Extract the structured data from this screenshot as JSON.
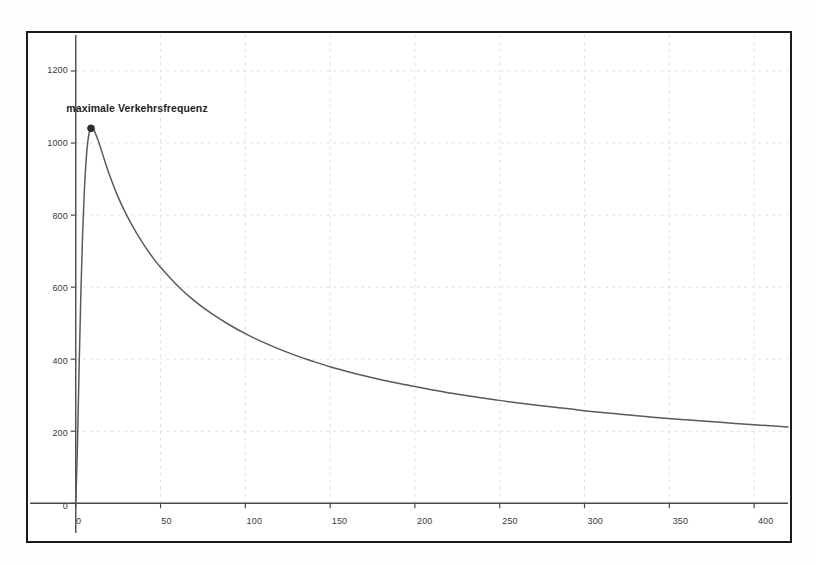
{
  "figure": {
    "background_color": "#fefefe",
    "frame_color": "#1b1b1b",
    "grid_color": "#e3dede",
    "curve_color": "#5a5a5a",
    "marker_color": "#2b2b2b",
    "text_color": "#3a3a3a"
  },
  "annotations": {
    "peak_label": "maximale Verkehrsfrequenz"
  },
  "chart_data": {
    "type": "line",
    "title": "",
    "subtitle": "",
    "xlabel": "",
    "ylabel": "",
    "xlim": [
      0,
      420
    ],
    "ylim": [
      0,
      1300
    ],
    "grid": true,
    "legend": false,
    "legend_position": "none",
    "xticks": [
      0,
      50,
      100,
      150,
      200,
      250,
      300,
      350,
      400
    ],
    "xticklabels": [
      "0",
      "50",
      "100",
      "150",
      "200",
      "250",
      "300",
      "350",
      "400"
    ],
    "yticks": [
      0,
      200,
      400,
      600,
      800,
      1000,
      1200
    ],
    "yticklabels": [
      "0",
      "200",
      "400",
      "600",
      "800",
      "1000",
      "1200"
    ],
    "series": [
      {
        "name": "Verkehrsfrequenz",
        "color": "#5a5a5a",
        "x": [
          0,
          1,
          2,
          3,
          4,
          5,
          6,
          7,
          8,
          9,
          10,
          11,
          12,
          13,
          14,
          15,
          17,
          20,
          25,
          30,
          35,
          40,
          45,
          50,
          60,
          70,
          80,
          90,
          100,
          110,
          120,
          130,
          140,
          150,
          160,
          170,
          180,
          190,
          200,
          215,
          230,
          245,
          260,
          280,
          300,
          320,
          340,
          360,
          380,
          400,
          420
        ],
        "y": [
          0,
          160,
          380,
          580,
          740,
          860,
          945,
          1000,
          1030,
          1041,
          1040,
          1033,
          1022,
          1010,
          996,
          982,
          952,
          910,
          850,
          800,
          757,
          719,
          685,
          655,
          604,
          562,
          527,
          497,
          471,
          448,
          428,
          410,
          394,
          379,
          366,
          354,
          343,
          333,
          324,
          311,
          299,
          289,
          279,
          268,
          257,
          248,
          239,
          232,
          225,
          218,
          212
        ]
      }
    ],
    "markers": [
      {
        "name": "maximale Verkehrsfrequenz",
        "x": 9,
        "y": 1041,
        "label": "maximale Verkehrsfrequenz"
      }
    ]
  }
}
